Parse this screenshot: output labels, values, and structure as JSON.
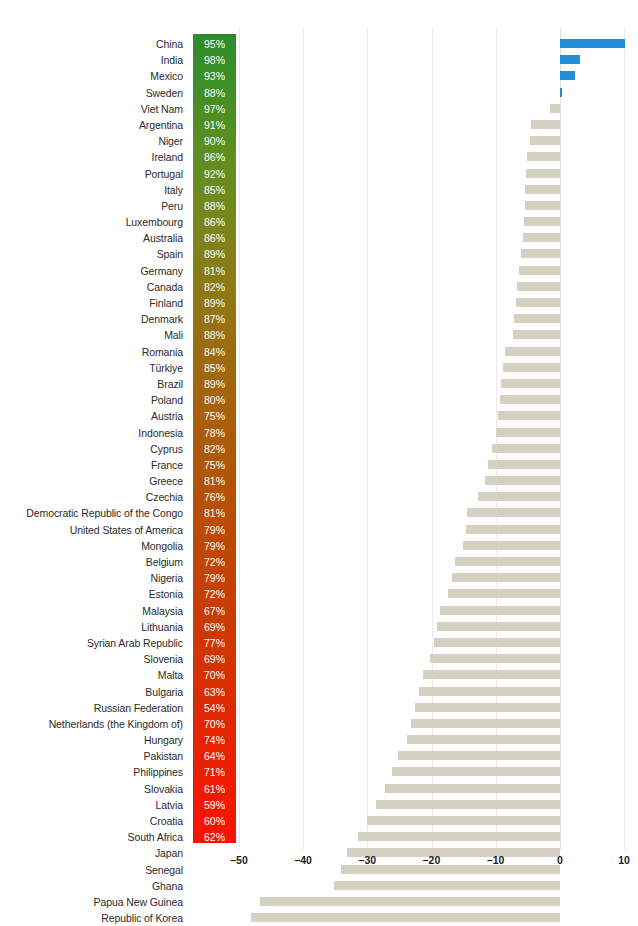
{
  "chart_data": {
    "type": "bar",
    "orientation": "horizontal",
    "title": "",
    "subtitle": "",
    "xlabel": "",
    "ylabel": "",
    "xlim": [
      -50,
      10
    ],
    "xticks": [
      -50,
      -40,
      -30,
      -20,
      -10,
      0,
      10
    ],
    "xtick_labels": [
      "–50",
      "–40",
      "–30",
      "–20",
      "–10",
      "0",
      "10"
    ],
    "grid": true,
    "legend": "none",
    "bar_color": "#d4d0c2",
    "positive_bar_color": "#1f8fd8",
    "gradient_top_color": "#2e8b2b",
    "gradient_bottom_color": "#f91200",
    "secondary_axis_label": "",
    "categories": [
      "China",
      "India",
      "Mexico",
      "Sweden",
      "Viet Nam",
      "Argentina",
      "Niger",
      "Ireland",
      "Portugal",
      "Italy",
      "Peru",
      "Luxembourg",
      "Australia",
      "Spain",
      "Germany",
      "Canada",
      "Finland",
      "Denmark",
      "Mali",
      "Romania",
      "Türkiye",
      "Brazil",
      "Poland",
      "Austria",
      "Indonesia",
      "Cyprus",
      "France",
      "Greece",
      "Czechia",
      "Democratic Republic of the Congo",
      "United States of America",
      "Mongolia",
      "Belgium",
      "Nigeria",
      "Estonia",
      "Malaysia",
      "Lithuania",
      "Syrian Arab Republic",
      "Slovenia",
      "Malta",
      "Bulgaria",
      "Russian Federation",
      "Netherlands (the Kingdom of)",
      "Hungary",
      "Pakistan",
      "Philippines",
      "Slovakia",
      "Latvia",
      "Croatia",
      "South Africa",
      "Japan",
      "Senegal",
      "Ghana",
      "Papua New Guinea",
      "Republic of Korea"
    ],
    "series": [
      {
        "name": "Change",
        "values": [
          10.2,
          3.2,
          2.4,
          0.3,
          -1.6,
          -4.5,
          -4.7,
          -5.1,
          -5.2,
          -5.4,
          -5.5,
          -5.6,
          -5.8,
          -6.0,
          -6.3,
          -6.6,
          -6.8,
          -7.1,
          -7.3,
          -8.6,
          -8.9,
          -9.1,
          -9.3,
          -9.6,
          -9.9,
          -10.6,
          -11.2,
          -11.6,
          -12.7,
          -14.4,
          -14.7,
          -15.1,
          -16.4,
          -16.8,
          -17.4,
          -18.6,
          -19.1,
          -19.6,
          -20.3,
          -21.3,
          -21.9,
          -22.6,
          -23.2,
          -23.8,
          -25.2,
          -26.1,
          -27.3,
          -28.6,
          -30.1,
          -31.4,
          -33.2,
          -34.1,
          -35.2,
          -46.8,
          -48.1
        ]
      },
      {
        "name": "Percent",
        "values": [
          "95%",
          "98%",
          "93%",
          "88%",
          "97%",
          "91%",
          "90%",
          "86%",
          "92%",
          "85%",
          "88%",
          "86%",
          "86%",
          "89%",
          "81%",
          "82%",
          "89%",
          "87%",
          "88%",
          "84%",
          "85%",
          "89%",
          "80%",
          "75%",
          "78%",
          "82%",
          "75%",
          "81%",
          "76%",
          "81%",
          "79%",
          "79%",
          "72%",
          "79%",
          "72%",
          "67%",
          "69%",
          "77%",
          "69%",
          "70%",
          "63%",
          "54%",
          "70%",
          "74%",
          "64%",
          "71%",
          "61%",
          "59%",
          "60%",
          "62%",
          "54%",
          "63%",
          "60%",
          "46%",
          "48%"
        ]
      }
    ]
  }
}
